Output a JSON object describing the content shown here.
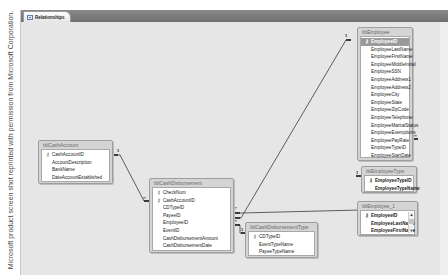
{
  "credit": "Microsoft product screen shot reprinted with permission from Microsoft Corporation.",
  "window": {
    "tab_label": "Relationships",
    "tab_icon": "relationships-icon"
  },
  "tables": {
    "employee": {
      "title": "tblEmployee",
      "fields": [
        {
          "name": "EmployeeID",
          "key": true
        },
        {
          "name": "EmployeeLastName"
        },
        {
          "name": "EmployeeFirstName"
        },
        {
          "name": "EmployeeMiddleInitial"
        },
        {
          "name": "EmployeeSSN"
        },
        {
          "name": "EmployeeAddress1"
        },
        {
          "name": "EmployeeAddress2"
        },
        {
          "name": "EmployeeCity"
        },
        {
          "name": "EmployeeState"
        },
        {
          "name": "EmployeeZipCode"
        },
        {
          "name": "EmployeeTelephone"
        },
        {
          "name": "EmployeeMaritalStatus"
        },
        {
          "name": "EmployeeExemptions"
        },
        {
          "name": "EmployeePayRate"
        },
        {
          "name": "EmployeeTypeID"
        },
        {
          "name": "EmployeeStartDate"
        }
      ]
    },
    "employee_type": {
      "title": "tblEmployeeType",
      "fields": [
        {
          "name": "EmployeeTypeID",
          "key": true
        },
        {
          "name": "EmployeeTypeName"
        }
      ]
    },
    "employee_1": {
      "title": "tblEmployee_1",
      "fields": [
        {
          "name": "EmployeeID",
          "key": true
        },
        {
          "name": "EmployeeLastName"
        },
        {
          "name": "EmployeeFirstName"
        }
      ]
    },
    "cash_account": {
      "title": "tblCashAccount",
      "fields": [
        {
          "name": "CashAccountID",
          "key": true
        },
        {
          "name": "AccountDescription"
        },
        {
          "name": "BankName"
        },
        {
          "name": "DateAccountEstablished"
        }
      ]
    },
    "cash_disbursement": {
      "title": "tblCashDisbursement",
      "fields": [
        {
          "name": "CheckNum",
          "key": true
        },
        {
          "name": "CashAccountID",
          "key": true
        },
        {
          "name": "CDTypeID"
        },
        {
          "name": "PayeeID"
        },
        {
          "name": "EmployeeID"
        },
        {
          "name": "EventID"
        },
        {
          "name": "CashDisbursementAmount"
        },
        {
          "name": "CashDisbursementDate"
        }
      ]
    },
    "cash_disbursement_type": {
      "title": "tblCashDisbursementType",
      "fields": [
        {
          "name": "CDTypeID",
          "key": true
        },
        {
          "name": "EventTypeName"
        },
        {
          "name": "PayeeTypeName"
        }
      ]
    }
  },
  "relationships": [
    {
      "from": "tblCashAccount.CashAccountID",
      "to": "tblCashDisbursement.CashAccountID",
      "one": "1",
      "many": "∞"
    },
    {
      "from": "tblEmployee.EmployeeID",
      "to": "tblCashDisbursement.EmployeeID",
      "one": "1",
      "many": "∞"
    },
    {
      "from": "tblEmployee_1.EmployeeID",
      "to": "tblCashDisbursement.PayeeID",
      "one": "1",
      "many": "∞"
    },
    {
      "from": "tblCashDisbursementType.CDTypeID",
      "to": "tblCashDisbursement.CDTypeID",
      "one": "1",
      "many": "∞"
    },
    {
      "from": "tblEmployeeType.EmployeeTypeID",
      "to": "tblEmployee.EmployeeTypeID",
      "one": "1",
      "many": "∞"
    }
  ],
  "labels": {
    "one": "1",
    "many": "∞"
  }
}
